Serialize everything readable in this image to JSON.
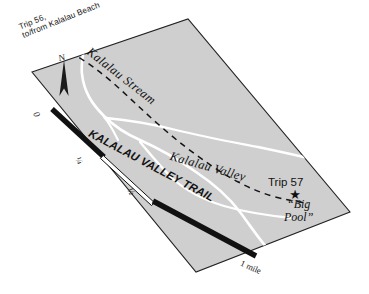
{
  "figure": {
    "kind": "trail-map",
    "region": "Kalalau Valley, Kauai",
    "orientation_label": "N",
    "panel_fill": "#cfcfcf",
    "panel_stroke": "#1a1a1a",
    "stream_color": "#ffffff",
    "trail_color": "#111111",
    "background": "#ffffff"
  },
  "labels": {
    "trip56_line1": "Trip 56,",
    "trip56_line2": "to/from Kalalau Beach",
    "stream": "Kalalau Stream",
    "valley": "Kalalau Valley",
    "trail": "KALALAU VALLEY TRAIL",
    "trip57": "Trip 57",
    "bigpool_line1": "“Big",
    "bigpool_line2": "Pool”",
    "north": "N"
  },
  "scale_bar": {
    "unit": "mile",
    "ticks": [
      {
        "id": "zero",
        "label": "0"
      },
      {
        "id": "quarter",
        "label": "¼"
      },
      {
        "id": "half",
        "label": "½"
      },
      {
        "id": "one",
        "label": "1 mile"
      }
    ],
    "segments": [
      {
        "from": "0",
        "to": "¼",
        "style": "filled"
      },
      {
        "from": "¼",
        "to": "½",
        "style": "hollow"
      },
      {
        "from": "½",
        "to": "1",
        "style": "filled"
      }
    ]
  },
  "markers": [
    {
      "id": "big-pool-star",
      "glyph": "★",
      "label": "“Big Pool”"
    }
  ],
  "features": [
    {
      "id": "kalalau-stream",
      "type": "stream",
      "render": "white-line"
    },
    {
      "id": "tributary-north",
      "type": "stream",
      "render": "white-line"
    },
    {
      "id": "tributary-south",
      "type": "stream",
      "render": "white-line"
    },
    {
      "id": "kalalau-valley-trail",
      "type": "trail",
      "render": "dashed-line"
    }
  ]
}
